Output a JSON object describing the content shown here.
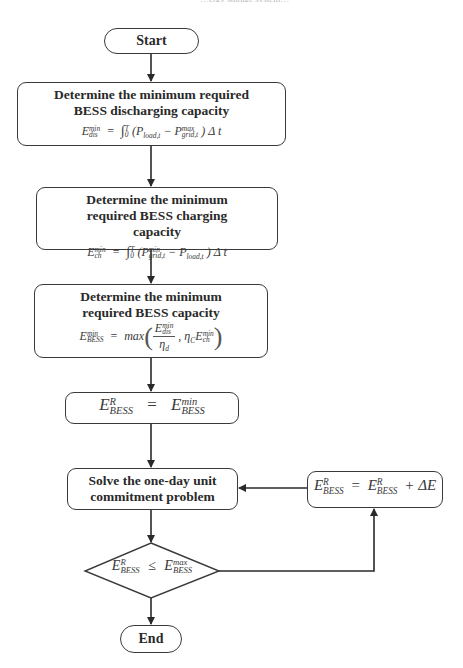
{
  "header_crop": {
    "text": "…ergy storage system…"
  },
  "nodes": {
    "start": {
      "label": "Start"
    },
    "discharge": {
      "title": "Determine the minimum required BESS discharging capacity",
      "formula": {
        "lhs_base": "E",
        "lhs_sup": "min",
        "lhs_sub": "dis",
        "eq": "=",
        "integral": "∫",
        "int_upper": "T",
        "int_lower": "0",
        "body_open": "(P",
        "term1_sub": "load,t",
        "minus": "− P",
        "term2_sup": "max",
        "term2_sub": "grid,t",
        "body_close": ") Δ t"
      }
    },
    "charge": {
      "title": "Determine the minimum required BESS charging capacity",
      "formula": {
        "lhs_base": "E",
        "lhs_sup": "min",
        "lhs_sub": "ch",
        "eq": "=",
        "integral": "∫",
        "int_upper": "T",
        "int_lower": "0",
        "body_open": "(P",
        "term1_sup": "min",
        "term1_sub": "grid,t",
        "minus": "− P",
        "term2_sub": "load,t",
        "body_close": ") Δ t"
      }
    },
    "capacity": {
      "title": "Determine the minimum required BESS capacity",
      "formula": {
        "lhs_base": "E",
        "lhs_sup": "min",
        "lhs_sub": "BESS",
        "eq": "=",
        "func": "max",
        "num_base": "E",
        "num_sup": "min",
        "num_sub": "dis",
        "den_base": "η",
        "den_sub": "d",
        "comma": ",",
        "eta_base": "η",
        "eta_sub": "C",
        "e2_base": "E",
        "e2_sup": "min",
        "e2_sub": "ch"
      }
    },
    "init": {
      "formula": {
        "lhs_base": "E",
        "lhs_sup": "R",
        "lhs_sub": "BESS",
        "eq": "=",
        "rhs_base": "E",
        "rhs_sup": "min",
        "rhs_sub": "BESS"
      }
    },
    "solve": {
      "title": "Solve the one-day unit commitment problem"
    },
    "update": {
      "formula": {
        "lhs_base": "E",
        "lhs_sup": "R",
        "lhs_sub": "BESS",
        "eq": "=",
        "rhs_base": "E",
        "rhs_sup": "R",
        "rhs_sub": "BESS",
        "plus": "+ ΔE"
      }
    },
    "decision": {
      "formula": {
        "lhs_base": "E",
        "lhs_sup": "R",
        "lhs_sub": "BESS",
        "op": "≤",
        "rhs_base": "E",
        "rhs_sup": "max",
        "rhs_sub": "BESS"
      }
    },
    "end": {
      "label": "End"
    }
  },
  "colors": {
    "stroke": "#3a3a3a",
    "text": "#2a2a2a",
    "background": "#ffffff"
  }
}
